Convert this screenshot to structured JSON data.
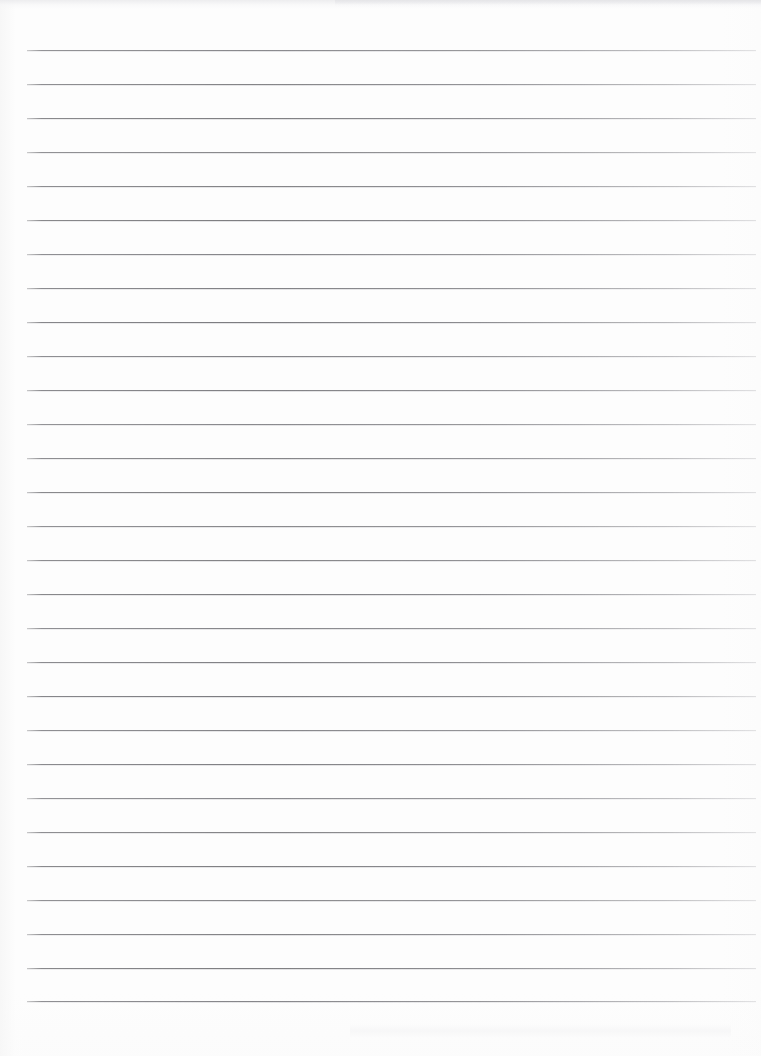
{
  "document": {
    "title": "Lined Paper Scan",
    "kind": "blank-ruled-notebook-page",
    "content_text": "",
    "page_width": 761,
    "page_height": 1056
  },
  "paper": {
    "background_color": "#fdfdfd",
    "rule_color": "#7a7a7e",
    "edge_shadow_color": "#ececee"
  },
  "ruling": {
    "line_count": 29,
    "first_line_y": 50,
    "line_spacing": 33.96,
    "line_start_x": 27,
    "line_end_x": 756,
    "line_thickness": 1,
    "lines_y": [
      50,
      84,
      118,
      152,
      186,
      220,
      254,
      288,
      322,
      356,
      390,
      424,
      458,
      492,
      526,
      560,
      594,
      628,
      662,
      696,
      730,
      764,
      798,
      832,
      866,
      900,
      934,
      968,
      1001
    ]
  },
  "margins": {
    "top_margin": 50,
    "bottom_margin": 55,
    "left_margin": 27,
    "right_margin": 5
  },
  "artifacts": {
    "top_scan_band": true,
    "bottom_scan_smudge": true
  }
}
